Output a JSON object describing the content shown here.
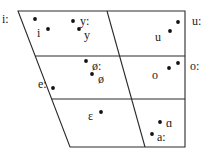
{
  "diagram": {
    "type": "vowel-chart",
    "outline": {
      "top_left": [
        18,
        11
      ],
      "top_right": [
        185,
        11
      ],
      "bottom_right": [
        185,
        147
      ],
      "bottom_left": [
        70,
        147
      ]
    },
    "horizontal_dividers_y": [
      56,
      99
    ],
    "center_divider": {
      "from": [
        107,
        11
      ],
      "to": [
        145,
        147
      ]
    },
    "vowels": [
      {
        "symbol": "i:",
        "label_xy": [
          2,
          19
        ],
        "dot": [
          35,
          19
        ]
      },
      {
        "symbol": "i",
        "label_xy": [
          37,
          33
        ],
        "dot": [
          48,
          29
        ]
      },
      {
        "symbol": "y:",
        "label_xy": [
          80,
          21
        ],
        "dot": [
          73,
          21
        ]
      },
      {
        "symbol": "y",
        "label_xy": [
          84,
          35
        ],
        "dot": [
          79,
          29
        ]
      },
      {
        "symbol": "u:",
        "label_xy": [
          192,
          21
        ],
        "dot": [
          178,
          22
        ]
      },
      {
        "symbol": "u",
        "label_xy": [
          155,
          37
        ],
        "dot": [
          170,
          31
        ]
      },
      {
        "symbol": "ø:",
        "label_xy": [
          92,
          66
        ],
        "dot": [
          86,
          61
        ]
      },
      {
        "symbol": "ø",
        "label_xy": [
          98,
          79
        ],
        "dot": [
          92,
          74
        ]
      },
      {
        "symbol": "e:",
        "label_xy": [
          38,
          84
        ],
        "dot": [
          53,
          88
        ]
      },
      {
        "symbol": "o:",
        "label_xy": [
          190,
          66
        ],
        "dot": [
          178,
          63
        ]
      },
      {
        "symbol": "o",
        "label_xy": [
          152,
          75
        ],
        "dot": [
          169,
          68
        ]
      },
      {
        "symbol": "ε",
        "label_xy": [
          88,
          116
        ],
        "dot": [
          101,
          112
        ]
      },
      {
        "symbol": "ɑ",
        "label_xy": [
          166,
          123
        ],
        "dot": [
          160,
          122
        ]
      },
      {
        "symbol": "a:",
        "label_xy": [
          157,
          137
        ],
        "dot": [
          152,
          134
        ]
      }
    ]
  }
}
